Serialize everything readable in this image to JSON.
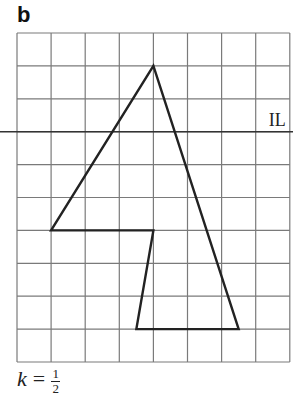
{
  "figure": {
    "part_label": "b",
    "line_label": "IL",
    "scale": {
      "variable": "k",
      "equals": "=",
      "numerator": "1",
      "denominator": "2"
    },
    "grid": {
      "columns": 8,
      "rows": 10,
      "left": 17,
      "top": 33,
      "cell_w": 34.1,
      "cell_h": 32.9,
      "color": "#7a7a7a"
    },
    "invariant_line_row": 3,
    "shape_vertices_grid": [
      [
        4,
        1
      ],
      [
        6.5,
        9
      ],
      [
        3.5,
        9
      ],
      [
        4,
        6
      ],
      [
        1,
        6
      ]
    ],
    "shape_color": "#222222"
  }
}
